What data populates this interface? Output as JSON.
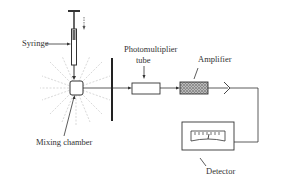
{
  "diagram": {
    "labels": {
      "syringe": "Syringe",
      "photomultiplier_line1": "Photomultiplier",
      "photomultiplier_line2": "tube",
      "amplifier": "Amplifier",
      "mixing_chamber": "Mixing chamber",
      "detector": "Detector"
    },
    "components": [
      "syringe",
      "mixing-chamber",
      "slit-barrier",
      "photomultiplier-tube",
      "amplifier",
      "output-connector",
      "detector-meter"
    ],
    "colors": {
      "line": "#333333",
      "rays": "#d8d8d8",
      "background": "#ffffff"
    }
  }
}
